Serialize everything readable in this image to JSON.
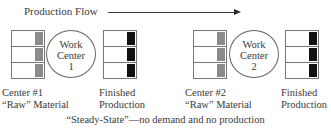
{
  "header": {
    "flow_label": "Production Flow",
    "arrow_direction": "right"
  },
  "centers": [
    {
      "id": 1,
      "work_center": {
        "line1": "Work",
        "line2": "Center",
        "line3": "1"
      },
      "raw_label": {
        "line1": "Center #1",
        "line2": "“Raw” Material"
      },
      "finished_label": {
        "line1": "Finished",
        "line2": "Production"
      },
      "raw_bins": 3,
      "finished_bins": 3
    },
    {
      "id": 2,
      "work_center": {
        "line1": "Work",
        "line2": "Center",
        "line3": "2"
      },
      "raw_label": {
        "line1": "Center #2",
        "line2": "“Raw” Material"
      },
      "finished_label": {
        "line1": "Finished",
        "line2": "Production"
      },
      "raw_bins": 3,
      "finished_bins": 3
    }
  ],
  "caption": "“Steady-State”—no demand and no production",
  "colors": {
    "raw_fill": "#8a8a8a",
    "finished_fill": "#111111",
    "outline": "#777777"
  }
}
